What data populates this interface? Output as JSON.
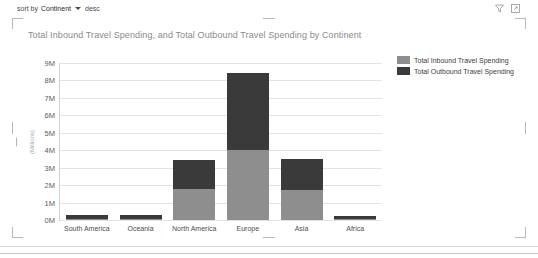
{
  "toolbar": {
    "sort_prefix": "sort by",
    "sort_field": "Continent",
    "sort_direction": "desc",
    "caret_icon": "chevron-down-icon",
    "filter_icon": "filter-icon",
    "focus_icon": "focus-mode-icon"
  },
  "chart_data": {
    "type": "bar",
    "stacked": true,
    "title": "Total Inbound Travel Spending, and Total Outbound Travel Spending by Continent",
    "xlabel": "",
    "ylabel": "(Millions)",
    "categories": [
      "South America",
      "Oceania",
      "North America",
      "Europe",
      "Asia",
      "Africa"
    ],
    "series": [
      {
        "name": "Total Inbound Travel Spending",
        "color": "#8e8e8e",
        "values": [
          0.05,
          0.06,
          1.8,
          4.0,
          1.7,
          0.05
        ]
      },
      {
        "name": "Total Outbound Travel Spending",
        "color": "#3a3a3a",
        "values": [
          0.25,
          0.24,
          1.65,
          4.4,
          1.8,
          0.2
        ]
      }
    ],
    "totals": [
      0.3,
      0.3,
      3.45,
      8.4,
      3.5,
      0.25
    ],
    "ylim": [
      0,
      9
    ],
    "ytick_values": [
      0,
      1,
      2,
      3,
      4,
      5,
      6,
      7,
      8,
      9
    ],
    "ytick_labels": [
      "0M",
      "1M",
      "2M",
      "3M",
      "4M",
      "5M",
      "6M",
      "7M",
      "8M",
      "9M"
    ],
    "grid": true,
    "legend_position": "right",
    "value_unit": "M"
  }
}
